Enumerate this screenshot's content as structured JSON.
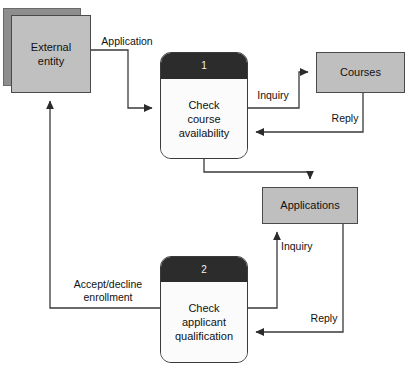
{
  "diagram": {
    "type": "data-flow-diagram",
    "width": 411,
    "height": 370,
    "background_color": "#ffffff",
    "colors": {
      "entity_fill": "#c0c0c0",
      "entity_shadow_fill": "#8e8e8e",
      "store_fill": "#bfbfbf",
      "process_header_fill": "#2c2c2c",
      "process_body_fill": "#fbfbfb",
      "line_color": "#3a3a3a",
      "text_color": "#111111"
    }
  },
  "nodes": {
    "external_entity": {
      "label_line1": "External",
      "label_line2": "entity",
      "shape": "double-rectangle"
    },
    "process_1": {
      "number": "1",
      "label_line1": "Check",
      "label_line2": "course",
      "label_line3": "availability",
      "shape": "rounded-rectangle"
    },
    "process_2": {
      "number": "2",
      "label_line1": "Check",
      "label_line2": "applicant",
      "label_line3": "qualification",
      "shape": "rounded-rectangle"
    },
    "store_courses": {
      "label": "Courses",
      "shape": "rectangle"
    },
    "store_applications": {
      "label": "Applications",
      "shape": "rectangle"
    }
  },
  "flows": [
    {
      "id": "application",
      "label": "Application",
      "from": "external_entity",
      "to": "process_1"
    },
    {
      "id": "inquiry-courses",
      "label": "Inquiry",
      "from": "process_1",
      "to": "store_courses"
    },
    {
      "id": "reply-courses",
      "label": "Reply",
      "from": "store_courses",
      "to": "process_1"
    },
    {
      "id": "process1-to-applications",
      "label": "",
      "from": "process_1",
      "to": "store_applications"
    },
    {
      "id": "inquiry-applications",
      "label": "Inquiry",
      "from": "process_2",
      "to": "store_applications"
    },
    {
      "id": "reply-applications",
      "label": "Reply",
      "from": "store_applications",
      "to": "process_2"
    },
    {
      "id": "accept-decline",
      "label_line1": "Accept/decline",
      "label_line2": "enrollment",
      "from": "process_2",
      "to": "external_entity"
    }
  ]
}
